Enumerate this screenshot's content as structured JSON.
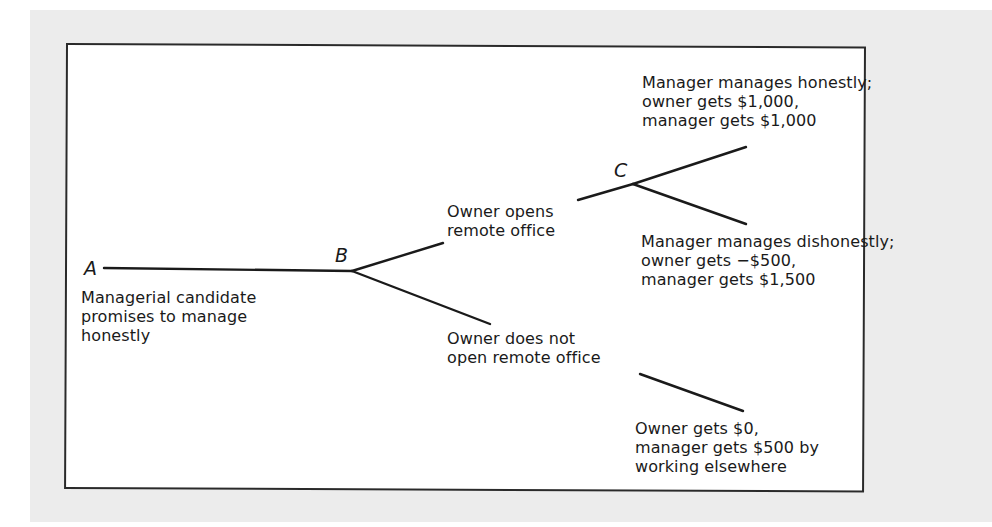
{
  "diagram": {
    "type": "game-tree",
    "colors": {
      "page_background": "#ececec",
      "frame_background": "#ffffff",
      "line": "#1a1a1a"
    },
    "nodes": {
      "A": {
        "label": "A",
        "description": [
          "Managerial candidate",
          "promises to manage",
          "honestly"
        ]
      },
      "B": {
        "label": "B"
      },
      "C": {
        "label": "C"
      }
    },
    "branches": {
      "open_office": [
        "Owner opens",
        "remote office"
      ],
      "no_office": [
        "Owner does not",
        "open remote office"
      ]
    },
    "outcomes": {
      "honest": [
        "Manager manages honestly;",
        "owner gets $1,000,",
        "manager gets $1,000"
      ],
      "dishonest": [
        "Manager manages dishonestly;",
        "owner gets −$500,",
        "manager gets $1,500"
      ],
      "no_office": [
        "Owner gets $0,",
        "manager gets $500 by",
        "working elsewhere"
      ]
    }
  }
}
